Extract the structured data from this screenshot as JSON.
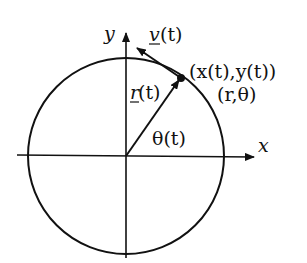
{
  "diagram": {
    "colors": {
      "stroke": "#111111",
      "background": "#ffffff"
    },
    "axes": {
      "x_label": "x",
      "y_label": "y"
    },
    "labels": {
      "velocity": "v(t)",
      "velocity_symbol": "v",
      "velocity_arg": "(t)",
      "position": "r(t)",
      "position_symbol": "r",
      "position_arg": "(t)",
      "point_cartesian": "(x(t),y(t))",
      "point_polar": "(r,θ)",
      "angle": "θ(t)"
    }
  }
}
